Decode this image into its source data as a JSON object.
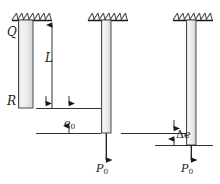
{
  "figure": {
    "background": "#ffffff",
    "ink": "#1a1a1a"
  },
  "labels": {
    "q": "Q",
    "r": "R",
    "length": "L",
    "e0_base": "e",
    "e0_sub": "0",
    "delta_e_symbol": "Δ",
    "delta_e_base": "e",
    "p0_left_base": "P",
    "p0_left_sub": "0",
    "p0_right_base": "P",
    "p0_right_sub": "0"
  },
  "bars": [
    {
      "name": "bar-unloaded",
      "x": 18,
      "y": 20,
      "width": 15,
      "height": 88,
      "fill_light": "#f2f2f2",
      "fill_dark": "#d8d8d8",
      "stroke": "#3a3a3a"
    },
    {
      "name": "bar-loaded-p0",
      "x": 101,
      "y": 20,
      "width": 10,
      "height": 113,
      "fill_light": "#f2f2f2",
      "fill_dark": "#d8d8d8",
      "stroke": "#3a3a3a"
    },
    {
      "name": "bar-loaded-p0-delta",
      "x": 186,
      "y": 20,
      "width": 10,
      "height": 125,
      "fill_light": "#f2f2f2",
      "fill_dark": "#d8d8d8",
      "stroke": "#3a3a3a"
    }
  ],
  "supports": [
    {
      "name": "fixed-support-left",
      "x": 12,
      "width": 40,
      "y": 20
    },
    {
      "name": "fixed-support-middle",
      "x": 88,
      "width": 40,
      "y": 20
    },
    {
      "name": "fixed-support-right",
      "x": 173,
      "width": 40,
      "y": 20
    }
  ],
  "dimensions": {
    "length_L": {
      "from_y": 20,
      "to_y": 108,
      "x": 52
    },
    "e0": {
      "top_y": 108,
      "bottom_y": 133,
      "left_x": 36,
      "right_x": 101
    },
    "delta_e": {
      "top_y": 133,
      "bottom_y": 145,
      "left_x": 121,
      "right_x": 186
    }
  },
  "loads": [
    {
      "name": "load-arrow-middle",
      "x": 106,
      "from_y": 133,
      "to_y": 162
    },
    {
      "name": "load-arrow-right",
      "x": 191,
      "from_y": 145,
      "to_y": 162
    }
  ]
}
